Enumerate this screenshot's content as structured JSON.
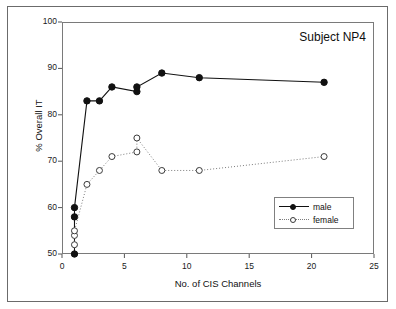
{
  "chart_data": {
    "type": "scatter",
    "title": "Subject NP4",
    "xlabel": "No. of CIS Channels",
    "ylabel": "% Overall IT",
    "xlim": [
      0,
      25
    ],
    "ylim": [
      50,
      100
    ],
    "xticks": [
      0,
      5,
      10,
      15,
      20,
      25
    ],
    "yticks": [
      50,
      60,
      70,
      80,
      90,
      100
    ],
    "grid": false,
    "legend_position": "lower right",
    "series": [
      {
        "name": "male",
        "marker": "filled-circle",
        "line": "solid",
        "color": "#111111",
        "x": [
          1,
          1,
          1,
          2,
          3,
          4,
          6,
          6,
          8,
          11,
          21
        ],
        "y": [
          50,
          58,
          60,
          83,
          83,
          86,
          85,
          86,
          89,
          88,
          87
        ]
      },
      {
        "name": "female",
        "marker": "open-circle",
        "line": "dotted",
        "color": "#7d7d7d",
        "x": [
          1,
          1,
          1,
          2,
          3,
          4,
          6,
          6,
          8,
          11,
          21
        ],
        "y": [
          52,
          54,
          55,
          65,
          68,
          71,
          72,
          75,
          68,
          68,
          71
        ]
      }
    ]
  },
  "legend": {
    "entries": [
      {
        "label": "male"
      },
      {
        "label": "female"
      }
    ]
  },
  "axis": {
    "x_tick_labels": [
      "0",
      "5",
      "10",
      "15",
      "20",
      "25"
    ],
    "y_tick_labels": [
      "50",
      "60",
      "70",
      "80",
      "90",
      "100"
    ]
  }
}
